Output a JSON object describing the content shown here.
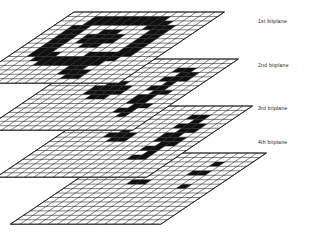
{
  "figure": {
    "type": "exploded-stack-diagram",
    "plane_count": 4,
    "grid_cols": 16,
    "grid_rows": 16,
    "colors": {
      "cell_on": "#101010",
      "cell_off": "#ffffff",
      "grid_line": "#1a1a1a",
      "background": "#ffffff",
      "label": "#1a1a1a"
    },
    "geometry": {
      "shear_x_per_row": 6.6,
      "cell_w": 9.4,
      "cell_h": 4.45,
      "plane_origin_x": 74,
      "plane_origin_y": 12,
      "plane_step_x": 14,
      "plane_step_y": 47
    }
  },
  "labels": {
    "plane1": "1st bitplane",
    "plane2": "2nd bitplane",
    "plane3": "3rd bitplane",
    "plane4": "4th bitplane"
  },
  "label_positions": [
    {
      "x": 258,
      "y": 23
    },
    {
      "x": 258,
      "y": 67
    },
    {
      "x": 258,
      "y": 110
    },
    {
      "x": 258,
      "y": 144
    }
  ],
  "planes": [
    {
      "name": "1st bitplane",
      "index": 1,
      "bits": [
        "0000000000000000",
        "0001111111100000",
        "0001111111110000",
        "0011000000111000",
        "0011001100011000",
        "0011011110011000",
        "0011011110011000",
        "0011001100011000",
        "0011000000011000",
        "0011100011111000",
        "0001111111110000",
        "0000111111100000",
        "0000000011000000",
        "0000000011100000",
        "0000000001100000",
        "0000000000000000"
      ]
    },
    {
      "name": "2nd bitplane",
      "index": 2,
      "bits": [
        "0000000000000000",
        "0000000000000000",
        "0000000000011000",
        "0000000000001100",
        "0000000000011100",
        "0000001100001000",
        "0000011110011000",
        "0000011110001100",
        "0000001100011000",
        "0000000000011000",
        "0000000000001100",
        "0000000000011000",
        "0000000000001000",
        "0000000000000000",
        "0000000000000000",
        "0000000000000000"
      ]
    },
    {
      "name": "3rd bitplane",
      "index": 3,
      "bits": [
        "0000000000000000",
        "0000000000000000",
        "0000000000011000",
        "0000000000001000",
        "0000000000011100",
        "0000001000001100",
        "0000011100011000",
        "0000001100011100",
        "0000000000001100",
        "0000000000011000",
        "0000000000001000",
        "0000000000011000",
        "0000000000000000",
        "0000000000000000",
        "0000000000000000",
        "0000000000000000"
      ]
    },
    {
      "name": "4th bitplane",
      "index": 4,
      "bits": [
        "0000000000000000",
        "0000000000000000",
        "0000000000001000",
        "0000000000000000",
        "0000000000011000",
        "0000000000000000",
        "0000001100000000",
        "0000000000001000",
        "0000000000000000",
        "0000000000000000",
        "0000000000000000",
        "0000000000000000",
        "0000000000000000",
        "0000000000000000",
        "0000000000000000",
        "0000000000000000"
      ]
    }
  ]
}
